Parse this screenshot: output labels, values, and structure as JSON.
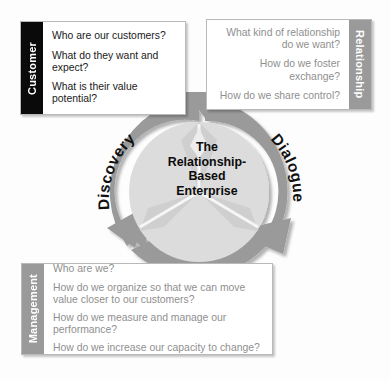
{
  "diagram": {
    "center": {
      "lines": [
        "The",
        "Relationship-",
        "Based",
        "Enterprise"
      ]
    },
    "ring_labels": {
      "discovery": "Discovery",
      "dialogue": "Dialogue",
      "discipline": "Discipline"
    },
    "colors": {
      "ring": "#9a9a9a",
      "inner_disc": "#dcdcdc",
      "customer_tab": "#0a0a0a",
      "relationship_tab": "#9a9a9a",
      "management_tab": "#9a9a9a",
      "box_text_dark": "#1a1a1a",
      "box_text_grey": "#8f8f8f",
      "page_background": "#fdfdfd"
    },
    "boxes": {
      "customer": {
        "tab_label": "Customer",
        "questions": [
          "Who are our customers?",
          "What do they want and expect?",
          "What is their value potential?"
        ]
      },
      "relationship": {
        "tab_label": "Relationship",
        "questions": [
          "What kind of relationship do we want?",
          "How do we foster exchange?",
          "How do we share control?"
        ]
      },
      "management": {
        "tab_label": "Management",
        "questions": [
          "Who are we?",
          "How do we organize so that we can move value closer to our customers?",
          "How do we measure and manage our performance?",
          "How do we increase our capacity to change?"
        ]
      }
    }
  }
}
